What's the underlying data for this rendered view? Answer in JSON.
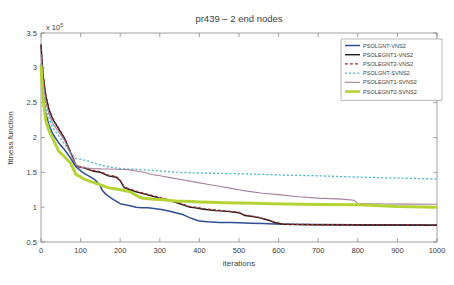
{
  "figure": {
    "title": "pr439 – 2 end nodes",
    "y_multiplier": "x 10",
    "y_multiplier_exp": "5"
  },
  "chart_data": {
    "type": "line",
    "title": "pr439 – 2 end nodes",
    "xlabel": "iterations",
    "ylabel": "fitness function",
    "xlim": [
      0,
      1000
    ],
    "ylim": [
      0.5,
      3.5
    ],
    "y_axis_multiplier": 100000,
    "grid": false,
    "legend_position": "top-right",
    "xticks": [
      "0",
      "100",
      "200",
      "300",
      "400",
      "500",
      "600",
      "700",
      "800",
      "900",
      "1000"
    ],
    "yticks": [
      "0.5",
      "1",
      "1.5",
      "2",
      "2.5",
      "3",
      "3.5"
    ],
    "series": [
      {
        "name": "PSOLGNT-VNS2",
        "color": "#2f4f93",
        "style": "solid",
        "width": 1.5,
        "x": [
          0,
          5,
          12,
          20,
          30,
          45,
          60,
          75,
          88,
          95,
          105,
          120,
          135,
          148,
          155,
          165,
          180,
          200,
          215,
          225,
          240,
          255,
          270,
          285,
          300,
          320,
          340,
          360,
          375,
          390,
          400,
          420,
          450,
          480,
          500,
          530,
          560,
          590,
          620,
          700,
          800,
          900,
          1000
        ],
        "y": [
          3.02,
          2.62,
          2.35,
          2.18,
          2.05,
          1.92,
          1.82,
          1.7,
          1.58,
          1.55,
          1.5,
          1.45,
          1.4,
          1.32,
          1.24,
          1.18,
          1.12,
          1.05,
          1.03,
          1.02,
          1.0,
          0.99,
          0.99,
          0.98,
          0.97,
          0.95,
          0.92,
          0.89,
          0.85,
          0.82,
          0.8,
          0.79,
          0.78,
          0.78,
          0.775,
          0.77,
          0.765,
          0.76,
          0.755,
          0.75,
          0.748,
          0.745,
          0.742
        ]
      },
      {
        "name": "PSOLEGNT1-VNS2",
        "color": "#1b1b1b",
        "style": "solid",
        "width": 1.4,
        "x": [
          0,
          5,
          12,
          20,
          30,
          45,
          60,
          75,
          88,
          95,
          110,
          130,
          150,
          170,
          190,
          200,
          210,
          225,
          240,
          260,
          280,
          300,
          320,
          340,
          360,
          375,
          390,
          410,
          440,
          470,
          500,
          515,
          530,
          550,
          570,
          590,
          610,
          650,
          700,
          800,
          900,
          1000
        ],
        "y": [
          3.33,
          2.9,
          2.6,
          2.4,
          2.26,
          2.12,
          1.98,
          1.78,
          1.6,
          1.58,
          1.56,
          1.52,
          1.5,
          1.45,
          1.43,
          1.38,
          1.28,
          1.25,
          1.22,
          1.19,
          1.16,
          1.13,
          1.1,
          1.07,
          1.03,
          1.0,
          0.99,
          0.97,
          0.95,
          0.94,
          0.92,
          0.88,
          0.87,
          0.85,
          0.82,
          0.78,
          0.755,
          0.75,
          0.748,
          0.745,
          0.743,
          0.74
        ]
      },
      {
        "name": "PSOLEGNT2-VNS2",
        "color": "#9b2d2d",
        "style": "dashed",
        "width": 1.3,
        "x": [
          0,
          5,
          12,
          20,
          30,
          45,
          60,
          75,
          88,
          95,
          110,
          130,
          150,
          170,
          190,
          200,
          210,
          225,
          240,
          260,
          280,
          300,
          320,
          340,
          360,
          375,
          390,
          410,
          440,
          470,
          500,
          515,
          530,
          550,
          570,
          590,
          610,
          650,
          700,
          800,
          900,
          1000
        ],
        "y": [
          3.34,
          2.92,
          2.62,
          2.42,
          2.27,
          2.13,
          1.99,
          1.79,
          1.61,
          1.59,
          1.57,
          1.53,
          1.51,
          1.46,
          1.44,
          1.39,
          1.29,
          1.26,
          1.23,
          1.2,
          1.17,
          1.14,
          1.11,
          1.08,
          1.04,
          1.01,
          1.0,
          0.98,
          0.96,
          0.945,
          0.925,
          0.885,
          0.875,
          0.855,
          0.825,
          0.785,
          0.757,
          0.752,
          0.75,
          0.747,
          0.745,
          0.742
        ]
      },
      {
        "name": "PSOLGNT-SVNS2",
        "color": "#49b6d6",
        "style": "dotted",
        "width": 1.3,
        "x": [
          0,
          5,
          12,
          20,
          30,
          45,
          60,
          75,
          88,
          100,
          120,
          140,
          160,
          180,
          200,
          230,
          260,
          300,
          340,
          380,
          420,
          460,
          500,
          560,
          620,
          700,
          780,
          850,
          920,
          1000
        ],
        "y": [
          3.05,
          2.7,
          2.45,
          2.28,
          2.14,
          2.02,
          1.9,
          1.78,
          1.7,
          1.69,
          1.66,
          1.62,
          1.59,
          1.57,
          1.555,
          1.545,
          1.535,
          1.52,
          1.5,
          1.492,
          1.488,
          1.484,
          1.48,
          1.47,
          1.46,
          1.45,
          1.435,
          1.425,
          1.415,
          1.405
        ]
      },
      {
        "name": "PSOLEGNT1-SVNS2",
        "color": "#a87f9e",
        "style": "solid",
        "width": 1.1,
        "x": [
          0,
          5,
          12,
          20,
          30,
          45,
          60,
          75,
          88,
          95,
          110,
          130,
          150,
          170,
          190,
          210,
          225,
          240,
          260,
          280,
          300,
          330,
          360,
          390,
          420,
          450,
          480,
          500,
          520,
          560,
          600,
          650,
          700,
          760,
          790,
          800,
          830,
          870,
          920,
          1000
        ],
        "y": [
          3.2,
          2.8,
          2.52,
          2.34,
          2.2,
          2.08,
          1.95,
          1.76,
          1.6,
          1.58,
          1.565,
          1.555,
          1.55,
          1.548,
          1.545,
          1.54,
          1.535,
          1.52,
          1.5,
          1.47,
          1.45,
          1.42,
          1.39,
          1.36,
          1.33,
          1.3,
          1.27,
          1.25,
          1.23,
          1.2,
          1.18,
          1.15,
          1.13,
          1.115,
          1.1,
          1.05,
          1.048,
          1.046,
          1.044,
          1.042
        ]
      },
      {
        "name": "PSOLEGNT2-SVNS2",
        "color": "#b5d334",
        "style": "solid",
        "width": 3.0,
        "x": [
          0,
          5,
          12,
          20,
          30,
          45,
          60,
          75,
          88,
          95,
          110,
          130,
          150,
          170,
          190,
          210,
          225,
          240,
          255,
          270,
          285,
          300,
          320,
          340,
          360,
          380,
          400,
          430,
          460,
          500,
          540,
          580,
          620,
          700,
          800,
          900,
          1000
        ],
        "y": [
          3.03,
          2.55,
          2.25,
          2.1,
          1.98,
          1.8,
          1.72,
          1.63,
          1.47,
          1.45,
          1.4,
          1.36,
          1.32,
          1.28,
          1.26,
          1.24,
          1.22,
          1.17,
          1.13,
          1.12,
          1.115,
          1.11,
          1.1,
          1.09,
          1.085,
          1.08,
          1.075,
          1.07,
          1.065,
          1.06,
          1.055,
          1.05,
          1.045,
          1.04,
          1.035,
          1.01,
          1.0
        ]
      }
    ]
  },
  "legend": {
    "items": [
      {
        "label": "PSOLGNT-VNS2"
      },
      {
        "label": "PSOLEGNT1-VNS2"
      },
      {
        "label": "PSOLEGNT2-VNS2"
      },
      {
        "label": "PSOLGNT-SVNS2"
      },
      {
        "label": "PSOLEGNT1-SVNS2"
      },
      {
        "label": "PSOLEGNT2-SVNS2"
      }
    ]
  }
}
